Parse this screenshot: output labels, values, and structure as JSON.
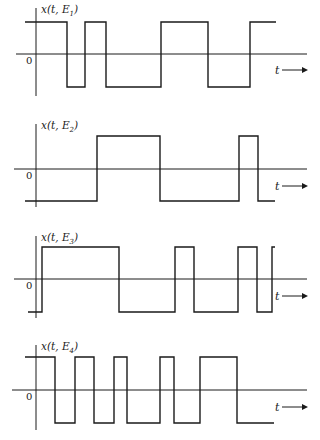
{
  "panels": [
    {
      "label_prefix": "x(t, E",
      "label_sub": "1",
      "label_suffix": ")",
      "zero_label": "0",
      "t_label": "t",
      "axis_x": 36,
      "high_y": 22,
      "base_y": 54,
      "low_y": 87,
      "axis_top": 8,
      "axis_bottom": 96,
      "axis_left": 16,
      "axis_right": 307,
      "start_x": 25,
      "end_x": 276,
      "start_level": "high",
      "transitions": [
        67,
        85,
        106,
        161,
        208,
        250
      ],
      "t_y": 70
    },
    {
      "label_prefix": "x(t, E",
      "label_sub": "2",
      "label_suffix": ")",
      "zero_label": "0",
      "t_label": "t",
      "axis_x": 36,
      "high_y": 136,
      "base_y": 169,
      "low_y": 201,
      "axis_top": 124,
      "axis_bottom": 207,
      "axis_left": 14,
      "axis_right": 307,
      "start_x": 25,
      "end_x": 275,
      "start_level": "low",
      "transitions": [
        97,
        160,
        239,
        258
      ],
      "t_y": 186
    },
    {
      "label_prefix": "x(t, E",
      "label_sub": "3",
      "label_suffix": ")",
      "zero_label": "0",
      "t_label": "t",
      "axis_x": 36,
      "high_y": 247,
      "base_y": 279,
      "low_y": 312,
      "axis_top": 236,
      "axis_bottom": 318,
      "axis_left": 14,
      "axis_right": 307,
      "start_x": 28,
      "end_x": 275,
      "start_level": "low",
      "transitions": [
        42,
        119,
        175,
        194,
        238,
        257,
        272
      ],
      "t_y": 296
    },
    {
      "label_prefix": "x(t, E",
      "label_sub": "4",
      "label_suffix": ")",
      "zero_label": "0",
      "t_label": "t",
      "axis_x": 36,
      "high_y": 357,
      "base_y": 390,
      "low_y": 423,
      "axis_top": 345,
      "axis_bottom": 430,
      "axis_left": 12,
      "axis_right": 307,
      "start_x": 25,
      "end_x": 274,
      "start_level": "high",
      "transitions": [
        55,
        75,
        94,
        114,
        127,
        160,
        174,
        200,
        237
      ],
      "t_y": 407
    }
  ],
  "colors": {
    "stroke": "#1a1a1a",
    "background": "#ffffff"
  }
}
